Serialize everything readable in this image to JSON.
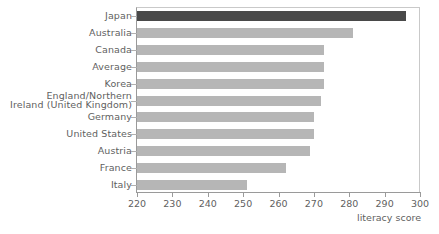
{
  "chart_data": {
    "type": "bar",
    "orientation": "horizontal",
    "title": "",
    "xlabel": "literacy score",
    "ylabel": "",
    "xlim": [
      220,
      300
    ],
    "xticks": [
      220,
      230,
      240,
      250,
      260,
      270,
      280,
      290,
      300
    ],
    "grid": false,
    "legend": null,
    "categories": [
      "Japan",
      "Australia",
      "Canada",
      "Average",
      "Korea",
      "England/Northern Ireland (United Kingdom)",
      "Germany",
      "United States",
      "Austria",
      "France",
      "Italy"
    ],
    "values": [
      296,
      281,
      273,
      273,
      273,
      272,
      270,
      270,
      269,
      262,
      251
    ],
    "highlight_category": "Japan",
    "colors": {
      "bar": "#b6b6b6",
      "highlight_bar": "#494949",
      "axis": "#9a9a9a",
      "frame": "#c9c9c9",
      "text": "#5f5f5f"
    }
  },
  "axis": {
    "tick_labels": [
      "220",
      "230",
      "240",
      "250",
      "260",
      "270",
      "280",
      "290",
      "300"
    ],
    "title": "literacy score"
  },
  "categories": {
    "items": [
      {
        "label": "Japan",
        "line1": "Japan",
        "line2": ""
      },
      {
        "label": "Australia",
        "line1": "Australia",
        "line2": ""
      },
      {
        "label": "Canada",
        "line1": "Canada",
        "line2": ""
      },
      {
        "label": "Average",
        "line1": "Average",
        "line2": ""
      },
      {
        "label": "Korea",
        "line1": "Korea",
        "line2": ""
      },
      {
        "label": "England/Northern Ireland (United Kingdom)",
        "line1": "England/Northern",
        "line2": "Ireland (United Kingdom)"
      },
      {
        "label": "Germany",
        "line1": "Germany",
        "line2": ""
      },
      {
        "label": "United States",
        "line1": "United States",
        "line2": ""
      },
      {
        "label": "Austria",
        "line1": "Austria",
        "line2": ""
      },
      {
        "label": "France",
        "line1": "France",
        "line2": ""
      },
      {
        "label": "Italy",
        "line1": "Italy",
        "line2": ""
      }
    ]
  }
}
